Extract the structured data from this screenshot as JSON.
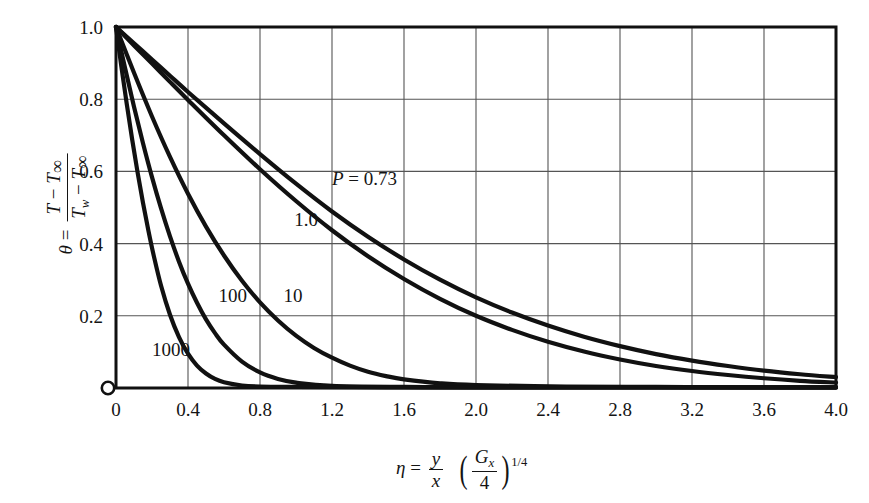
{
  "figure": {
    "kind": "line-chart",
    "background": "#ffffff",
    "ink_color": "#111111",
    "grid_color": "#555555"
  },
  "axis_labels": {
    "y": {
      "theta": "θ",
      "equals": "=",
      "numerator": "T − T∞",
      "denominator": "Tw − T∞",
      "plain": "θ = (T − T∞) / (Tw − T∞)"
    },
    "x": {
      "eta": "η",
      "equals": "=",
      "numerator": "y",
      "denominator": "x",
      "group_numerator": "Gx",
      "group_denominator": "4",
      "exponent": "1/4",
      "plain": "η = (y/x) (Gx/4)^(1/4)"
    }
  },
  "chart_data": {
    "type": "line",
    "title": "",
    "xlabel": "η = (y/x)(Gx/4)^(1/4)",
    "ylabel": "θ = (T − T∞)/(Tw − T∞)",
    "xlim": [
      0,
      4.0
    ],
    "ylim": [
      0,
      1.0
    ],
    "xticks": [
      "0",
      "0.4",
      "0.8",
      "1.2",
      "1.6",
      "2.0",
      "2.4",
      "2.8",
      "3.2",
      "3.6",
      "4.0"
    ],
    "xtick_values": [
      0,
      0.4,
      0.8,
      1.2,
      1.6,
      2.0,
      2.4,
      2.8,
      3.2,
      3.6,
      4.0
    ],
    "yticks": [
      "0.2",
      "0.4",
      "0.6",
      "0.8",
      "1.0"
    ],
    "ytick_values": [
      0.2,
      0.4,
      0.6,
      0.8,
      1.0
    ],
    "grid": true,
    "legend": "inline-curve-labels",
    "origin_marker": "open-circle",
    "series": [
      {
        "name": "P = 0.73",
        "label": "P = 0.73",
        "label_x": 1.2,
        "label_y": 0.58,
        "x": [
          0,
          0.1,
          0.2,
          0.3,
          0.4,
          0.6,
          0.8,
          1.0,
          1.2,
          1.4,
          1.6,
          1.8,
          2.0,
          2.2,
          2.4,
          2.6,
          2.8,
          3.0,
          3.2,
          3.4,
          3.6,
          3.8,
          4.0
        ],
        "values": [
          1.0,
          0.955,
          0.91,
          0.865,
          0.82,
          0.733,
          0.648,
          0.566,
          0.489,
          0.419,
          0.356,
          0.3,
          0.251,
          0.209,
          0.173,
          0.142,
          0.116,
          0.094,
          0.076,
          0.061,
          0.048,
          0.038,
          0.03
        ]
      },
      {
        "name": "1.0",
        "label": "1.0",
        "label_x": 0.99,
        "label_y": 0.465,
        "x": [
          0,
          0.1,
          0.2,
          0.3,
          0.4,
          0.6,
          0.8,
          1.0,
          1.2,
          1.4,
          1.6,
          1.8,
          2.0,
          2.2,
          2.4,
          2.6,
          2.8,
          3.0,
          3.2,
          3.4,
          3.6,
          3.8,
          4.0
        ],
        "values": [
          1.0,
          0.949,
          0.899,
          0.848,
          0.798,
          0.7,
          0.606,
          0.518,
          0.437,
          0.365,
          0.302,
          0.247,
          0.2,
          0.161,
          0.128,
          0.101,
          0.079,
          0.061,
          0.047,
          0.036,
          0.027,
          0.02,
          0.015
        ]
      },
      {
        "name": "10",
        "label": "10",
        "label_x": 0.93,
        "label_y": 0.255,
        "x": [
          0,
          0.1,
          0.2,
          0.3,
          0.4,
          0.5,
          0.6,
          0.7,
          0.8,
          0.9,
          1.0,
          1.1,
          1.2,
          1.3,
          1.4,
          1.5,
          1.6,
          1.8,
          2.0,
          2.5,
          3.0,
          3.5,
          4.0
        ],
        "values": [
          1.0,
          0.873,
          0.752,
          0.64,
          0.538,
          0.447,
          0.367,
          0.297,
          0.237,
          0.187,
          0.145,
          0.111,
          0.084,
          0.062,
          0.045,
          0.033,
          0.024,
          0.013,
          0.008,
          0.004,
          0.003,
          0.002,
          0.002
        ]
      },
      {
        "name": "100",
        "label": "100",
        "label_x": 0.57,
        "label_y": 0.255,
        "x": [
          0,
          0.05,
          0.1,
          0.15,
          0.2,
          0.25,
          0.3,
          0.35,
          0.4,
          0.45,
          0.5,
          0.55,
          0.6,
          0.7,
          0.8,
          0.9,
          1.0,
          1.2,
          1.6,
          2.0,
          3.0,
          4.0
        ],
        "values": [
          1.0,
          0.887,
          0.779,
          0.678,
          0.584,
          0.498,
          0.42,
          0.35,
          0.289,
          0.236,
          0.19,
          0.152,
          0.12,
          0.073,
          0.043,
          0.025,
          0.015,
          0.006,
          0.003,
          0.002,
          0.002,
          0.002
        ]
      },
      {
        "name": "1000",
        "label": "1000",
        "label_x": 0.2,
        "label_y": 0.105,
        "x": [
          0,
          0.03,
          0.06,
          0.09,
          0.12,
          0.15,
          0.18,
          0.21,
          0.25,
          0.3,
          0.35,
          0.4,
          0.45,
          0.5,
          0.55,
          0.6,
          0.7,
          0.8,
          1.0,
          1.5,
          2.0,
          3.0,
          4.0
        ],
        "values": [
          1.0,
          0.89,
          0.786,
          0.688,
          0.597,
          0.513,
          0.436,
          0.366,
          0.284,
          0.203,
          0.141,
          0.095,
          0.062,
          0.04,
          0.025,
          0.016,
          0.007,
          0.004,
          0.003,
          0.002,
          0.002,
          0.002,
          0.002
        ]
      }
    ]
  }
}
